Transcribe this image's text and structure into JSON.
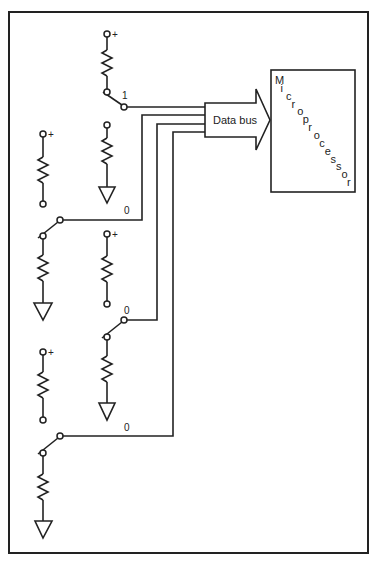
{
  "diagram": {
    "bus_label": "Data bus",
    "processor_label": "Microprocessor",
    "supply_symbol": "+",
    "switches": [
      {
        "name": "switch-1",
        "state": "1"
      },
      {
        "name": "switch-2",
        "state": "0"
      },
      {
        "name": "switch-3",
        "state": "0"
      },
      {
        "name": "switch-4",
        "state": "0"
      }
    ]
  }
}
